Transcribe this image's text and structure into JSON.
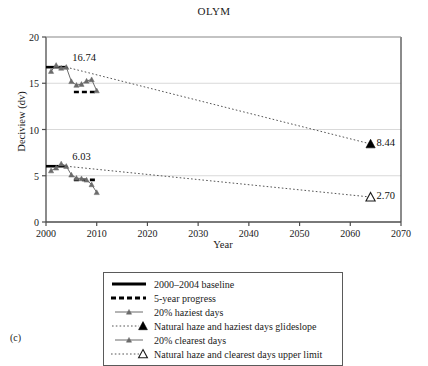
{
  "figure": {
    "panel_label": "(c)"
  },
  "chart_data": {
    "type": "line",
    "title": "OLYM",
    "xlabel": "Year",
    "ylabel": "Deciview (dv)",
    "xlim": [
      2000,
      2070
    ],
    "ylim": [
      0,
      20
    ],
    "xticks": [
      2000,
      2010,
      2020,
      2030,
      2040,
      2050,
      2060,
      2070
    ],
    "yticks": [
      0,
      5,
      10,
      15,
      20
    ],
    "grid": "horizontal",
    "legend_position": "below-axes",
    "annotations": [
      {
        "text": "16.74",
        "x": 2004.0,
        "y": 16.74
      },
      {
        "text": "6.03",
        "x": 2004.0,
        "y": 6.03
      },
      {
        "text": "8.44",
        "x": 2064.0,
        "y": 8.44
      },
      {
        "text": "2.70",
        "x": 2064.0,
        "y": 2.7
      }
    ],
    "series": [
      {
        "name": "2000–2004 baseline",
        "key": "baseline-haziest",
        "type": "segment",
        "style": "solid-thick",
        "color": "#000000",
        "x": [
          2000.0,
          2004.0
        ],
        "values": [
          16.74,
          16.74
        ]
      },
      {
        "name": "2000–2004 baseline",
        "key": "baseline-clearest",
        "type": "segment",
        "style": "solid-thick",
        "color": "#000000",
        "x": [
          2000.0,
          2004.0
        ],
        "values": [
          6.03,
          6.03
        ]
      },
      {
        "name": "5-year progress",
        "key": "progress-haziest",
        "type": "segment",
        "style": "dashed-thick",
        "color": "#000000",
        "x": [
          2005.5,
          2010.0
        ],
        "values": [
          14.05,
          14.05
        ]
      },
      {
        "name": "5-year progress",
        "key": "progress-clearest",
        "type": "segment",
        "style": "dashed-thick",
        "color": "#000000",
        "x": [
          2005.5,
          2010.0
        ],
        "values": [
          4.55,
          4.55
        ]
      },
      {
        "name": "20% haziest days",
        "key": "haziest-days",
        "type": "line-marker",
        "style": "solid-thin-marker",
        "color": "#6b6b6b",
        "marker": "triangle-filled-small",
        "x": [
          2001.0,
          2002.0,
          2003.0,
          2004.0,
          2005.0,
          2006.0,
          2007.0,
          2008.0,
          2009.0,
          2010.0
        ],
        "values": [
          16.3,
          16.95,
          16.65,
          16.74,
          15.2,
          14.8,
          14.9,
          15.25,
          15.4,
          14.2
        ]
      },
      {
        "name": "Natural haze and haziest days glideslope",
        "key": "glideslope-haziest",
        "type": "line-endpoint",
        "style": "dotted-thin",
        "color": "#555555",
        "marker": "triangle-filled",
        "x": [
          2004.0,
          2064.0
        ],
        "values": [
          16.74,
          8.44
        ]
      },
      {
        "name": "20% clearest days",
        "key": "clearest-days",
        "type": "line-marker",
        "style": "solid-thin-marker",
        "color": "#6b6b6b",
        "marker": "triangle-filled-small",
        "x": [
          2001.0,
          2002.0,
          2003.0,
          2004.0,
          2005.0,
          2006.0,
          2007.0,
          2008.0,
          2009.0,
          2010.0
        ],
        "values": [
          5.55,
          5.85,
          6.3,
          6.03,
          5.1,
          4.75,
          4.7,
          4.55,
          4.05,
          3.2
        ]
      },
      {
        "name": "Natural haze and clearest days upper limit",
        "key": "upper-limit-clearest",
        "type": "line-endpoint",
        "style": "dotted-thin",
        "color": "#555555",
        "marker": "triangle-open",
        "x": [
          2004.0,
          2064.0
        ],
        "values": [
          6.03,
          2.7
        ]
      }
    ],
    "legend": [
      {
        "label": "2000–2004 baseline",
        "key": "solid-thick"
      },
      {
        "label": "5-year progress",
        "key": "dashed-thick"
      },
      {
        "label": "20% haziest days",
        "key": "line-marker-small"
      },
      {
        "label": "Natural haze and haziest days glideslope",
        "key": "dotted-triangle-filled"
      },
      {
        "label": "20% clearest days",
        "key": "line-marker-small"
      },
      {
        "label": "Natural haze and clearest days upper limit",
        "key": "dotted-triangle-open"
      }
    ]
  }
}
